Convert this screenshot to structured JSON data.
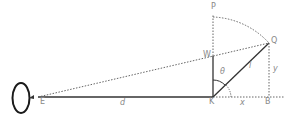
{
  "diagram": {
    "type": "geometry",
    "colors": {
      "solid": "#333333",
      "dotted": "#666666",
      "label": "#888888",
      "eye": "#1a1a1a"
    },
    "points": {
      "E": {
        "label": "E",
        "x": 40,
        "y": 97
      },
      "K": {
        "label": "K",
        "x": 213,
        "y": 97
      },
      "W": {
        "label": "W",
        "x": 213,
        "y": 56
      },
      "P": {
        "label": "P",
        "x": 213,
        "y": 14
      },
      "Q": {
        "label": "Q",
        "x": 269,
        "y": 43
      },
      "B": {
        "label": "B",
        "x": 269,
        "y": 97
      }
    },
    "segments": {
      "d": {
        "label": "d",
        "from": "E",
        "to": "K"
      },
      "x": {
        "label": "x",
        "from": "K",
        "to": "B"
      },
      "y": {
        "label": "y",
        "from": "B",
        "to": "Q"
      },
      "l": {
        "label": "l",
        "from": "K",
        "to": "Q"
      }
    },
    "angle": {
      "label": "θ",
      "vertex": "K",
      "between": [
        "W",
        "Q"
      ]
    }
  }
}
